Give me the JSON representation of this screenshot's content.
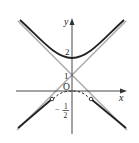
{
  "diagram": {
    "type": "function-graph",
    "axes": {
      "x_label": "x",
      "y_label": "y",
      "origin_label": "O"
    },
    "tick_labels": {
      "y_two": "2",
      "y_one": "1",
      "y_neg_half_num": "1",
      "y_neg_half_den": "2",
      "y_neg_half_sign": "−"
    },
    "curves": [
      {
        "name": "upper-branch",
        "style": "solid-thick",
        "vertex": [
          0,
          2
        ]
      },
      {
        "name": "lower-branch",
        "style": "solid-thick-with-dashed-middle",
        "open_endpoints": true
      },
      {
        "name": "asymptote-1",
        "style": "solid-thin",
        "passes_through": [
          0,
          1
        ]
      },
      {
        "name": "asymptote-2",
        "style": "solid-thin",
        "passes_through": [
          0,
          1
        ]
      }
    ],
    "colors": {
      "curve": "#222222",
      "asymptote": "#9a9a9a",
      "axis": "#333333"
    }
  }
}
